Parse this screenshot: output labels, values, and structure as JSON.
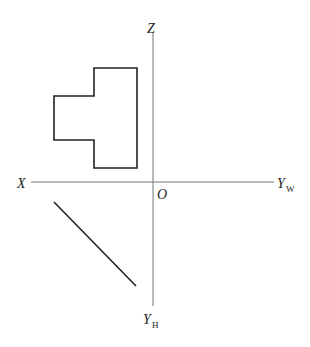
{
  "diagram": {
    "type": "orthographic projection axes",
    "labels": {
      "z": "Z",
      "x": "X",
      "origin": "O",
      "yw_main": "Y",
      "yw_sub": "W",
      "yh_main": "Y",
      "yh_sub": "H"
    },
    "colors": {
      "axis": "#777777",
      "shape": "#222222",
      "background": "#ffffff"
    },
    "axes": {
      "origin": [
        153,
        182
      ],
      "vertical": {
        "x": 153,
        "y1": 33,
        "y2": 306
      },
      "horizontal": {
        "y": 182,
        "x1": 31,
        "x2": 274
      }
    },
    "front_view_polygon": [
      [
        94,
        68
      ],
      [
        137,
        68
      ],
      [
        137,
        168
      ],
      [
        94,
        168
      ],
      [
        94,
        140
      ],
      [
        54,
        140
      ],
      [
        54,
        96
      ],
      [
        94,
        96
      ]
    ],
    "top_view_line": {
      "x1": 54,
      "y1": 202,
      "x2": 136,
      "y2": 286
    }
  }
}
